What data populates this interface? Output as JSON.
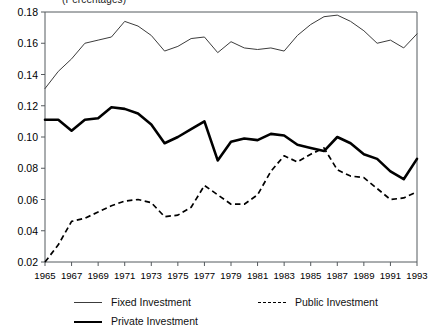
{
  "subtitle": "(Percentages)",
  "legend": {
    "items": [
      {
        "label": "Fixed Investment",
        "style": "solid-thin",
        "swatch_name": "legend-swatch-fixed"
      },
      {
        "label": "Public Investment",
        "style": "dashed",
        "swatch_name": "legend-swatch-public"
      },
      {
        "label": "Private Investment",
        "style": "solid-thick",
        "swatch_name": "legend-swatch-private"
      }
    ]
  },
  "chart_data": {
    "type": "line",
    "title": "",
    "subtitle": "(Percentages)",
    "xlabel": "",
    "ylabel": "",
    "xlim": [
      1965,
      1993
    ],
    "ylim": [
      0.02,
      0.18
    ],
    "grid": false,
    "legend_position": "bottom",
    "ytick_labels": [
      "0.02",
      "0.04",
      "0.06",
      "0.08",
      "0.10",
      "0.12",
      "0.14",
      "0.16",
      "0.18"
    ],
    "ytick_values": [
      0.02,
      0.04,
      0.06,
      0.08,
      0.1,
      0.12,
      0.14,
      0.16,
      0.18
    ],
    "xtick_labels": [
      "1965",
      "1967",
      "1969",
      "1971",
      "1973",
      "1975",
      "1977",
      "1979",
      "1981",
      "1983",
      "1985",
      "1987",
      "1989",
      "1991",
      "1993"
    ],
    "xtick_values": [
      1965,
      1967,
      1969,
      1971,
      1973,
      1975,
      1977,
      1979,
      1981,
      1983,
      1985,
      1987,
      1989,
      1991,
      1993
    ],
    "x": [
      1965,
      1966,
      1967,
      1968,
      1969,
      1970,
      1971,
      1972,
      1973,
      1974,
      1975,
      1976,
      1977,
      1978,
      1979,
      1980,
      1981,
      1982,
      1983,
      1984,
      1985,
      1986,
      1987,
      1988,
      1989,
      1990,
      1991,
      1992,
      1993
    ],
    "series": [
      {
        "name": "Fixed Investment",
        "style": "solid-thin",
        "values": [
          0.131,
          0.142,
          0.15,
          0.16,
          0.162,
          0.164,
          0.174,
          0.171,
          0.165,
          0.155,
          0.158,
          0.163,
          0.164,
          0.154,
          0.161,
          0.157,
          0.156,
          0.157,
          0.155,
          0.165,
          0.172,
          0.177,
          0.178,
          0.174,
          0.168,
          0.16,
          0.162,
          0.157,
          0.166
        ]
      },
      {
        "name": "Private Investment",
        "style": "solid-thick",
        "values": [
          0.111,
          0.111,
          0.104,
          0.111,
          0.112,
          0.119,
          0.118,
          0.115,
          0.108,
          0.096,
          0.1,
          0.105,
          0.11,
          0.085,
          0.097,
          0.099,
          0.098,
          0.102,
          0.101,
          0.095,
          0.093,
          0.091,
          0.1,
          0.096,
          0.089,
          0.086,
          0.078,
          0.073,
          0.086
        ]
      },
      {
        "name": "Public Investment",
        "style": "dashed",
        "values": [
          0.02,
          0.031,
          0.046,
          0.048,
          0.052,
          0.056,
          0.059,
          0.06,
          0.058,
          0.049,
          0.05,
          0.055,
          0.069,
          0.063,
          0.057,
          0.057,
          0.063,
          0.078,
          0.088,
          0.084,
          0.089,
          0.093,
          0.079,
          0.075,
          0.074,
          0.067,
          0.06,
          0.061,
          0.065
        ]
      }
    ]
  }
}
